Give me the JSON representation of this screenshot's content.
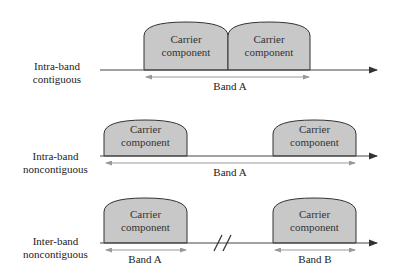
{
  "colors": {
    "carrier_fill": "#c8c8c8",
    "carrier_stroke": "#333333",
    "axis": "#444444",
    "band_arrow": "#999999"
  },
  "rows": [
    {
      "label_line1": "Intra-band",
      "label_line2": "contiguous",
      "carriers": [
        {
          "line1": "Carrier",
          "line2": "component"
        },
        {
          "line1": "Carrier",
          "line2": "component"
        }
      ],
      "bands": [
        {
          "label": "Band A"
        }
      ]
    },
    {
      "label_line1": "Intra-band",
      "label_line2": "noncontiguous",
      "carriers": [
        {
          "line1": "Carrier",
          "line2": "component"
        },
        {
          "line1": "Carrier",
          "line2": "component"
        }
      ],
      "bands": [
        {
          "label": "Band A"
        }
      ]
    },
    {
      "label_line1": "Inter-band",
      "label_line2": "noncontiguous",
      "carriers": [
        {
          "line1": "Carrier",
          "line2": "component"
        },
        {
          "line1": "Carrier",
          "line2": "component"
        }
      ],
      "bands": [
        {
          "label": "Band A"
        },
        {
          "label": "Band B"
        }
      ]
    }
  ]
}
